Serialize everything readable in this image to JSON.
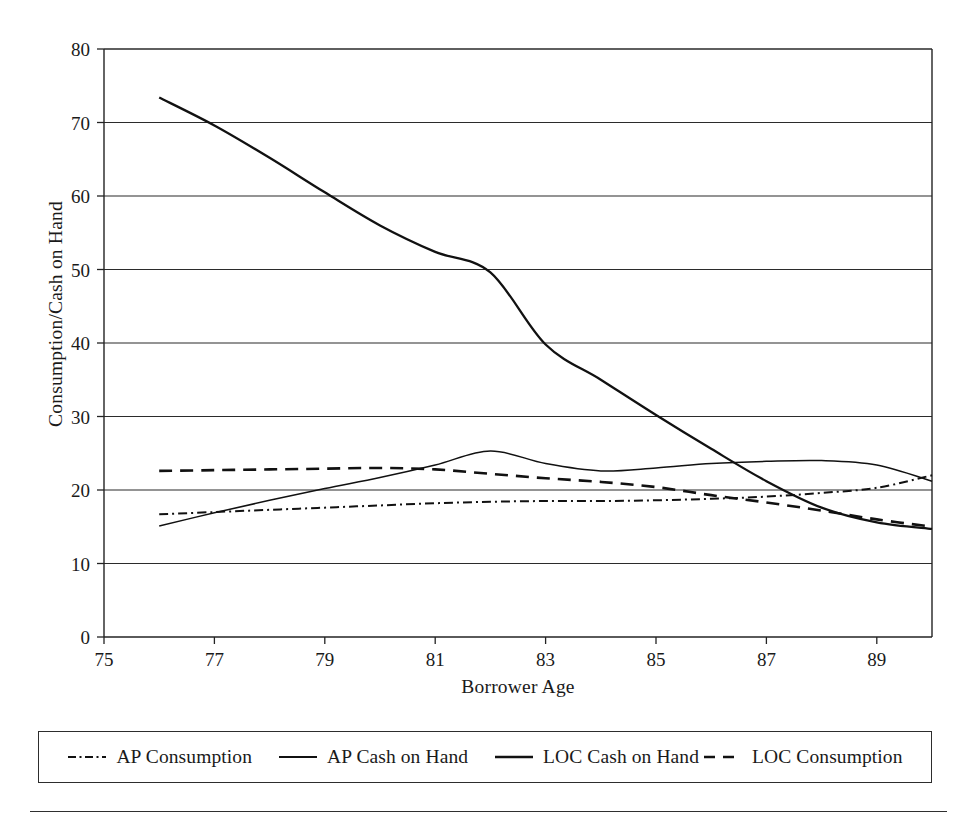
{
  "chart_data": {
    "type": "line",
    "title": "",
    "xlabel": "Borrower Age",
    "ylabel": "Consumption/Cash on Hand",
    "xlim": [
      75,
      90
    ],
    "ylim": [
      0,
      80
    ],
    "xticks": [
      75,
      77,
      79,
      81,
      83,
      85,
      87,
      89
    ],
    "yticks": [
      0,
      10,
      20,
      30,
      40,
      50,
      60,
      70,
      80
    ],
    "grid": "horizontal",
    "legend_position": "bottom",
    "x": [
      76,
      77,
      78,
      79,
      80,
      81,
      82,
      83,
      84,
      85,
      86,
      87,
      88,
      89,
      90
    ],
    "series": [
      {
        "name": "AP Consumption",
        "style": "dash-dot",
        "values": [
          16.7,
          17.0,
          17.3,
          17.6,
          17.9,
          18.2,
          18.4,
          18.5,
          18.5,
          18.6,
          18.8,
          19.1,
          19.6,
          20.3,
          22.0
        ]
      },
      {
        "name": "AP Cash on Hand",
        "style": "solid-thin",
        "values": [
          15.1,
          16.9,
          18.6,
          20.2,
          21.7,
          23.4,
          25.3,
          23.6,
          22.6,
          23.0,
          23.6,
          23.9,
          24.0,
          23.4,
          21.2
        ]
      },
      {
        "name": "LOC Cash on Hand",
        "style": "solid-thick",
        "values": [
          73.4,
          69.6,
          65.2,
          60.5,
          56.0,
          52.4,
          49.6,
          39.8,
          35.0,
          30.2,
          25.6,
          21.2,
          17.6,
          15.6,
          14.7
        ]
      },
      {
        "name": "LOC Consumption",
        "style": "dashed",
        "values": [
          22.6,
          22.7,
          22.8,
          22.9,
          23.0,
          22.8,
          22.2,
          21.6,
          21.1,
          20.4,
          19.3,
          18.3,
          17.2,
          16.0,
          15.0
        ]
      }
    ]
  },
  "axis": {
    "y_title": "Consumption/Cash on Hand",
    "x_title": "Borrower Age",
    "y_tick_labels": [
      "0",
      "10",
      "20",
      "30",
      "40",
      "50",
      "60",
      "70",
      "80"
    ],
    "x_tick_labels": [
      "75",
      "77",
      "79",
      "81",
      "83",
      "85",
      "87",
      "89"
    ]
  },
  "legend": {
    "items": [
      {
        "label": "AP Consumption",
        "style": "dash-dot"
      },
      {
        "label": "AP Cash on Hand",
        "style": "solid-thin"
      },
      {
        "label": "LOC Cash on Hand",
        "style": "solid-thick"
      },
      {
        "label": "LOC Consumption",
        "style": "dashed"
      }
    ]
  },
  "colors": {
    "ink": "#111111",
    "axis": "#232323",
    "background": "#ffffff"
  }
}
